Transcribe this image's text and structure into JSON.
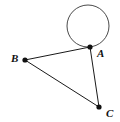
{
  "figure": {
    "width": 120,
    "height": 122,
    "background_color": "#ffffff",
    "stroke_color": "#1a1a1a",
    "circle_stroke_color": "#4a4a4a",
    "vertex_color": "#111111"
  },
  "points": [
    {
      "id": "A",
      "label": "A",
      "x": 90,
      "y": 47,
      "label_x": 97,
      "label_y": 57,
      "dot_radius": 2.6
    },
    {
      "id": "B",
      "label": "B",
      "x": 25,
      "y": 60,
      "label_x": 11,
      "label_y": 62,
      "dot_radius": 2.6
    },
    {
      "id": "C",
      "label": "C",
      "x": 99,
      "y": 107,
      "label_x": 106,
      "label_y": 117,
      "dot_radius": 2.6
    }
  ],
  "segments": [
    {
      "id": "BA",
      "label": "segment-b-a",
      "x1": 25,
      "y1": 60,
      "x2": 90,
      "y2": 47
    },
    {
      "id": "AC",
      "label": "segment-a-c",
      "x1": 90,
      "y1": 47,
      "x2": 99,
      "y2": 107
    },
    {
      "id": "BC",
      "label": "segment-b-c",
      "x1": 25,
      "y1": 60,
      "x2": 99,
      "y2": 107
    }
  ],
  "circle": {
    "id": "circle-at-A",
    "center_x": 88,
    "center_y": 26,
    "radius": 21
  }
}
